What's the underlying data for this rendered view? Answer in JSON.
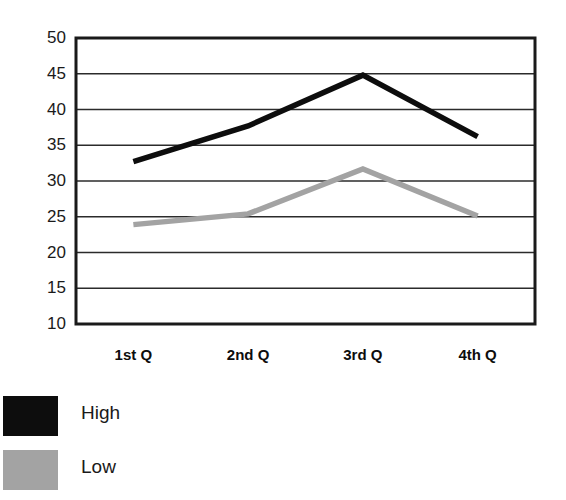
{
  "chart_data": {
    "type": "line",
    "title": "",
    "xlabel": "",
    "ylabel": "",
    "categories": [
      "1st Q",
      "2nd Q",
      "3rd Q",
      "4th Q"
    ],
    "series": [
      {
        "name": "High",
        "color": "#0d0d0d",
        "values": [
          32.7,
          37.7,
          44.8,
          36.2
        ]
      },
      {
        "name": "Low",
        "color": "#a3a3a3",
        "values": [
          23.9,
          25.4,
          31.7,
          25.1
        ]
      }
    ],
    "ylim": [
      10,
      50
    ],
    "yticks": [
      50,
      45,
      40,
      35,
      30,
      25,
      20,
      15,
      10
    ],
    "grid": true,
    "grid_axis": "y",
    "legend_position": "below-left",
    "legend": [
      {
        "label": "High",
        "swatch_color": "#0d0d0d"
      },
      {
        "label": "Low",
        "swatch_color": "#a3a3a3"
      }
    ],
    "plot_frame_color": "#1a1a1a",
    "background_color": "#ffffff"
  },
  "layout": {
    "plot_left": 76,
    "plot_top": 38,
    "plot_right": 535,
    "plot_bottom": 324
  }
}
